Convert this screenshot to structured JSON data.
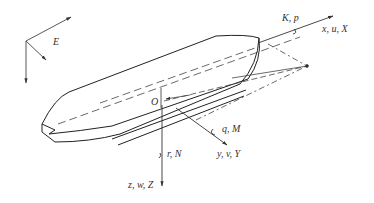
{
  "diagram": {
    "type": "ship-coordinate-system",
    "labels": {
      "earth_frame": "E",
      "origin": "O",
      "x_axis": "x, u, X",
      "y_axis": "y, v, Y",
      "z_axis": "z, w, Z",
      "roll": "K, p",
      "pitch": "q, M",
      "yaw": "r, N"
    },
    "colors": {
      "line": "#333333",
      "background": "#ffffff"
    }
  }
}
